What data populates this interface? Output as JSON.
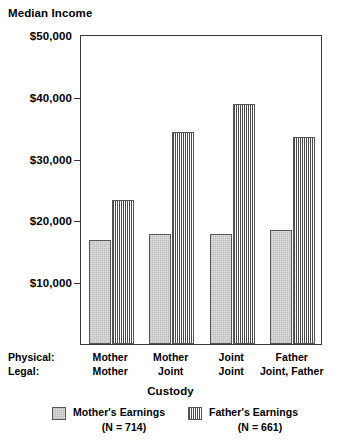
{
  "chart_data": {
    "type": "bar",
    "title": "Median Income",
    "xlabel": "Custody",
    "ylabel": "Median Income",
    "ylim": [
      0,
      50000
    ],
    "grid": false,
    "legend_position": "bottom",
    "categories": [
      "Mother / Mother",
      "Mother / Joint",
      "Joint / Joint",
      "Father / Joint, Father"
    ],
    "category_rows": {
      "physical_label": "Physical:",
      "legal_label": "Legal:",
      "physical": [
        "Mother",
        "Mother",
        "Joint",
        "Father"
      ],
      "legal": [
        "Mother",
        "Joint",
        "Joint",
        "Joint, Father"
      ]
    },
    "series": [
      {
        "name": "Mother's Earnings",
        "n_label": "(N = 714)",
        "values": [
          17000,
          18000,
          18000,
          18600
        ]
      },
      {
        "name": "Father's Earnings",
        "n_label": "(N = 661)",
        "values": [
          23500,
          34500,
          39000,
          33700
        ]
      }
    ],
    "y_ticks": [
      {
        "value": 50000,
        "label": "$50,000"
      },
      {
        "value": 40000,
        "label": "$40,000"
      },
      {
        "value": 30000,
        "label": "$30,000"
      },
      {
        "value": 20000,
        "label": "$20,000"
      },
      {
        "value": 10000,
        "label": "$10,000"
      }
    ]
  },
  "legend": {
    "items": [
      {
        "name": "Mother's Earnings",
        "sub": "(N = 714)",
        "swatch": "light-dotted-swatch"
      },
      {
        "name": "Father's Earnings",
        "sub": "(N = 661)",
        "swatch": "dark-checkered-swatch"
      }
    ]
  },
  "colors": {
    "axis": "#3a3a3a",
    "bar_border": "#555555",
    "mother_fill": "#e2e2e2",
    "father_fill": "#4a4a4a",
    "background": "#ffffff",
    "text": "#000000"
  }
}
